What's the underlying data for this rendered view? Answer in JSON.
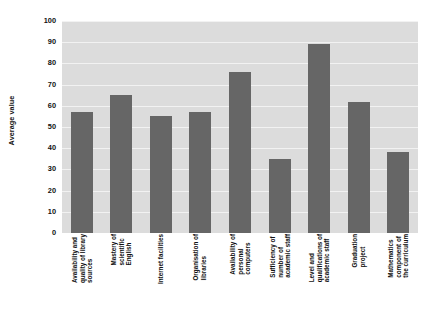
{
  "chart_data": {
    "type": "bar",
    "title": "",
    "subtitle": "",
    "xlabel": "",
    "ylabel": "Average value",
    "ylim": [
      0,
      100
    ],
    "ytick_step": 10,
    "yticks": [
      "100",
      "90",
      "80",
      "70",
      "60",
      "50",
      "40",
      "30",
      "20",
      "10",
      "0"
    ],
    "grid": "horizontal",
    "legend": "none",
    "bar_color": "#666666",
    "plot_background": "#dcdcdc",
    "gridline_color": "#f2f2f2",
    "categories": [
      "Availability and quality of library sources",
      "Mastery of scientific English",
      "Internet facilities",
      "Organisation of libraries",
      "Availability of personal computers",
      "Sufficiency of number of academic staff",
      "Level and qualifications of academic staff",
      "Graduation project",
      "Mathematics component of the curriculum"
    ],
    "category_lines": [
      [
        "Availability and",
        "quality of library",
        "sources"
      ],
      [
        "Mastery of",
        "scientific",
        "English"
      ],
      [
        "Internet facilities"
      ],
      [
        "Organisation of",
        "libraries"
      ],
      [
        "Availability of",
        "personal",
        "computers"
      ],
      [
        "Sufficiency of",
        "number of",
        "academic staff"
      ],
      [
        "Level and",
        "qualifications of",
        "academic staff"
      ],
      [
        "Graduation",
        "project"
      ],
      [
        "Mathematics",
        "component of",
        "the curriculum"
      ]
    ],
    "values": [
      57,
      65,
      55,
      57,
      76,
      35,
      89,
      62,
      38
    ]
  }
}
